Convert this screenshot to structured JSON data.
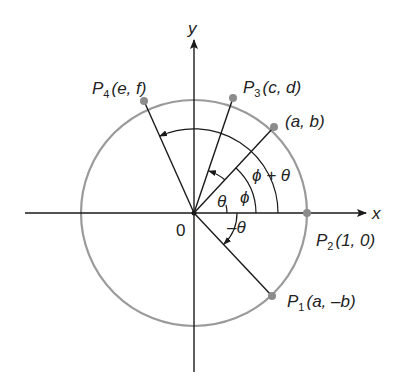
{
  "diagram": {
    "axes": {
      "x_label": "x",
      "y_label": "y",
      "origin_label": "0"
    },
    "points": {
      "p1": {
        "name": "P",
        "sub": "1",
        "coords": "(a, –b)"
      },
      "p2": {
        "name": "P",
        "sub": "2",
        "coords": "(1, 0)"
      },
      "p3": {
        "name": "P",
        "sub": "3",
        "coords": "(c, d)"
      },
      "p4": {
        "name": "P",
        "sub": "4",
        "coords": "(e, f)"
      },
      "pab": {
        "coords": "(a, b)"
      }
    },
    "angles": {
      "theta": "θ",
      "phi": "ϕ",
      "phi_plus_theta": "ϕ + θ",
      "neg_theta": "–θ"
    },
    "colors": {
      "circle": "#9a9a9a",
      "lines": "#1a1a1a",
      "points": "#8c8c8c"
    }
  }
}
